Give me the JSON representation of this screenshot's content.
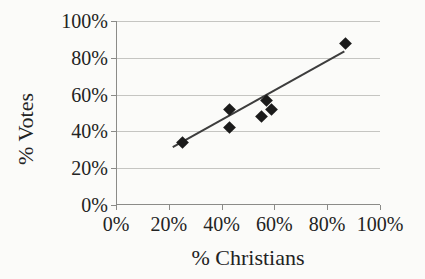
{
  "chart_data": {
    "type": "scatter",
    "title": "",
    "xlabel": "% Christians",
    "ylabel": "% Votes",
    "xlim": [
      0,
      100
    ],
    "ylim": [
      0,
      100
    ],
    "grid": "horizontal-only",
    "legend": "none",
    "marker": "filled-diamond",
    "x_ticks": [
      {
        "value": 0,
        "label": "0%"
      },
      {
        "value": 20,
        "label": "20%"
      },
      {
        "value": 40,
        "label": "40%"
      },
      {
        "value": 60,
        "label": "60%"
      },
      {
        "value": 80,
        "label": "80%"
      },
      {
        "value": 100,
        "label": "100%"
      }
    ],
    "y_ticks": [
      {
        "value": 0,
        "label": "0%"
      },
      {
        "value": 20,
        "label": "20%"
      },
      {
        "value": 40,
        "label": "40%"
      },
      {
        "value": 60,
        "label": "60%"
      },
      {
        "value": 80,
        "label": "80%"
      },
      {
        "value": 100,
        "label": "100%"
      }
    ],
    "points": [
      {
        "x": 25,
        "y": 34
      },
      {
        "x": 43,
        "y": 42
      },
      {
        "x": 43,
        "y": 52
      },
      {
        "x": 55,
        "y": 48
      },
      {
        "x": 57,
        "y": 57
      },
      {
        "x": 59,
        "y": 52
      },
      {
        "x": 87,
        "y": 88
      }
    ],
    "trendline": {
      "type": "linear",
      "x1": 21.5,
      "y1": 31.5,
      "x2": 86.5,
      "y2": 83.5
    },
    "colors": {
      "background": "#fbfbf9",
      "text": "#232323",
      "gridline": "#c5c5c2",
      "axis": "#8b8b88",
      "marker": "#1b1b1b",
      "trendline": "#3d3d3d"
    }
  }
}
